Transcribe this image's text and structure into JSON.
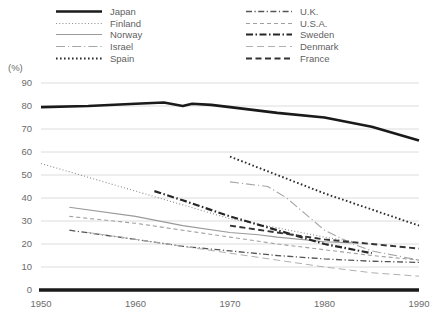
{
  "chart_data": {
    "type": "line",
    "title": "",
    "subtitle": "",
    "xlabel": "",
    "ylabel": "(%)",
    "unit_label": "(%)",
    "xlim": [
      1948,
      1991
    ],
    "ylim": [
      0,
      95
    ],
    "grid": true,
    "legend_position": "top",
    "xticks": [
      "1950",
      "1960",
      "1970",
      "1980",
      "1990"
    ],
    "xtick_values": [
      1950,
      1960,
      1970,
      1980,
      1990
    ],
    "yticks": [
      "0",
      "10",
      "20",
      "30",
      "40",
      "50",
      "60",
      "70",
      "80",
      "90"
    ],
    "ytick_values": [
      0,
      10,
      20,
      30,
      40,
      50,
      60,
      70,
      80,
      90
    ],
    "series": [
      {
        "name": "Japan",
        "style": "solid",
        "width": 2.6,
        "color": "#1a1a1a",
        "x": [
          1950,
          1955,
          1960,
          1963,
          1965,
          1966,
          1968,
          1970,
          1975,
          1980,
          1985,
          1990
        ],
        "values": [
          79.5,
          80.0,
          81.0,
          81.5,
          80.0,
          81.0,
          80.5,
          79.5,
          77.0,
          75.0,
          71.0,
          65.0
        ]
      },
      {
        "name": "Finland",
        "style": "dotted",
        "width": 1.1,
        "color": "#8c8c8c",
        "x": [
          1950,
          1955,
          1960,
          1965,
          1970,
          1975,
          1980,
          1983
        ],
        "values": [
          55.0,
          49.0,
          43.0,
          37.0,
          31.0,
          27.0,
          23.0,
          21.0
        ]
      },
      {
        "name": "Norway",
        "style": "solid",
        "width": 1.1,
        "color": "#9a9a9a",
        "x": [
          1953,
          1960,
          1965,
          1970,
          1973,
          1975,
          1980,
          1983
        ],
        "values": [
          36.0,
          32.0,
          28.0,
          25.0,
          24.0,
          23.0,
          21.0,
          20.5
        ]
      },
      {
        "name": "Israel",
        "style": "longdashdot",
        "width": 1.1,
        "color": "#a5a5a5",
        "x": [
          1970,
          1974,
          1976,
          1978,
          1980,
          1983,
          1985,
          1990
        ],
        "values": [
          47.0,
          45.0,
          40.0,
          33.0,
          26.0,
          20.0,
          17.0,
          13.0
        ]
      },
      {
        "name": "Spain",
        "style": "dotted-bold",
        "width": 1.9,
        "color": "#2b2b2b",
        "x": [
          1970,
          1975,
          1980,
          1985,
          1990
        ],
        "values": [
          58.0,
          50.0,
          42.0,
          35.0,
          28.0
        ]
      },
      {
        "name": "U.K.",
        "style": "dashdot",
        "width": 1.3,
        "color": "#555555",
        "x": [
          1953,
          1960,
          1965,
          1970,
          1975,
          1980,
          1985,
          1990
        ],
        "values": [
          26.0,
          22.0,
          19.0,
          17.0,
          15.0,
          13.5,
          12.5,
          12.0
        ]
      },
      {
        "name": "U.S.A.",
        "style": "dashed-light",
        "width": 1.1,
        "color": "#a0a0a0",
        "x": [
          1953,
          1960,
          1965,
          1970,
          1975,
          1980,
          1985,
          1990
        ],
        "values": [
          32.0,
          29.0,
          26.0,
          23.0,
          20.0,
          17.5,
          15.0,
          13.0
        ]
      },
      {
        "name": "Sweden",
        "style": "dashdot-bold",
        "width": 2.2,
        "color": "#262626",
        "x": [
          1962,
          1965,
          1970,
          1975,
          1980,
          1985
        ],
        "values": [
          43.0,
          39.0,
          32.0,
          26.0,
          20.0,
          16.0
        ]
      },
      {
        "name": "Denmark",
        "style": "longdash-light",
        "width": 1.0,
        "color": "#b0b0b0",
        "x": [
          1955,
          1960,
          1965,
          1970,
          1975,
          1980,
          1985,
          1990
        ],
        "values": [
          25.0,
          22.0,
          19.0,
          16.0,
          13.0,
          10.0,
          7.5,
          6.0
        ]
      },
      {
        "name": "France",
        "style": "dashed-bold",
        "width": 1.9,
        "color": "#333333",
        "x": [
          1970,
          1975,
          1980,
          1985,
          1990
        ],
        "values": [
          28.0,
          25.0,
          22.0,
          20.0,
          18.0
        ]
      }
    ]
  },
  "legend": {
    "columns": [
      {
        "items": [
          "Japan",
          "Finland",
          "Norway",
          "Israel",
          "Spain"
        ]
      },
      {
        "items": [
          "U.K.",
          "U.S.A.",
          "Sweden",
          "Denmark",
          "France"
        ]
      }
    ]
  },
  "colors": {
    "axis": "#1a1a1a",
    "grid": "#d8d8d8",
    "text": "#6b6b6b"
  }
}
